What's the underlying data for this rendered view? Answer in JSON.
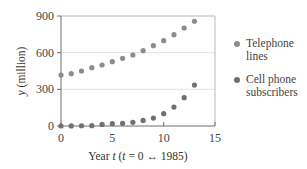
{
  "chart_data": {
    "type": "scatter",
    "title": "",
    "xlabel": "Year t (t = 0 ↔ 1985)",
    "xlabel_parts": {
      "word": "Year ",
      "var": "t",
      "open": " (",
      "var2": "t",
      "rest": " = 0 ↔ 1985)"
    },
    "ylabel": "y (million)",
    "ylabel_parts": {
      "var": "y",
      "rest": " (million)"
    },
    "xlim": [
      0,
      15
    ],
    "ylim": [
      0,
      900
    ],
    "x_ticks": [
      0,
      5,
      10,
      15
    ],
    "y_ticks": [
      0,
      300,
      600,
      900
    ],
    "grid": {
      "horizontal": true,
      "vertical": false
    },
    "legend_position": "right",
    "x": [
      0,
      1,
      2,
      3,
      4,
      5,
      6,
      7,
      8,
      9,
      10,
      11,
      12,
      13
    ],
    "series": [
      {
        "name": "Telephone lines",
        "label_lines": "Telephone\nlines",
        "color": "#8c8c8c",
        "values": [
          417,
          428,
          450,
          477,
          499,
          526,
          554,
          581,
          616,
          657,
          698,
          747,
          802,
          857
        ]
      },
      {
        "name": "Cell phone subscribers",
        "label_lines": "Cell phone\nsubscribers",
        "color": "#707070",
        "values": [
          0,
          1,
          2,
          3,
          13,
          19,
          22,
          30,
          46,
          65,
          101,
          155,
          232,
          335
        ]
      }
    ]
  },
  "colors": {
    "axis": "#6e6e6e",
    "frame": "#b8b8b8",
    "grid": "#e2e2e2"
  }
}
